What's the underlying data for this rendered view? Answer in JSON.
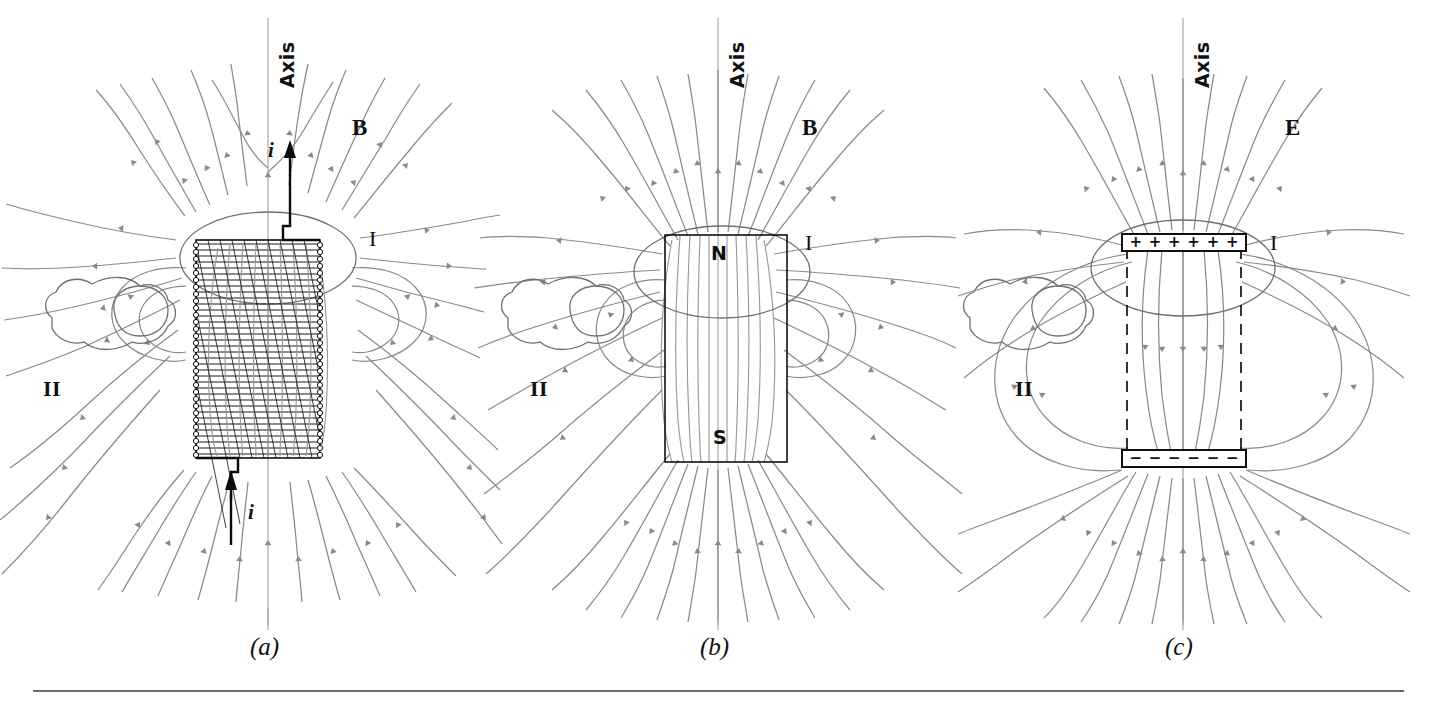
{
  "figure": {
    "caption_rule": true,
    "panels": [
      {
        "id": "a",
        "panel_label": "(a)",
        "axis_label": "Axis",
        "field_symbol": "B",
        "surface_I_label": "I",
        "surface_II_label": "II",
        "current_label_top": "i",
        "current_label_bottom": "i",
        "device": "solenoid",
        "device_description": "current-carrying solenoid with helical windings"
      },
      {
        "id": "b",
        "panel_label": "(b)",
        "axis_label": "Axis",
        "field_symbol": "B",
        "surface_I_label": "I",
        "surface_II_label": "II",
        "pole_top": "N",
        "pole_bottom": "S",
        "device": "bar-magnet",
        "device_description": "bar magnet with north pole up and south pole down"
      },
      {
        "id": "c",
        "panel_label": "(c)",
        "axis_label": "Axis",
        "field_symbol": "E",
        "surface_I_label": "I",
        "surface_II_label": "II",
        "device": "electric-dipole",
        "device_description": "parallel charged plates forming an electric dipole",
        "top_plate_signs": [
          "+",
          "+",
          "+",
          "+",
          "+",
          "+"
        ],
        "bottom_plate_signs": [
          "−",
          "−",
          "−",
          "−",
          "−",
          "−"
        ]
      }
    ]
  },
  "colors": {
    "field_line": "#8a8a8a",
    "axis_line": "#a8a8a8",
    "surface_outline": "#707070",
    "device_outline": "#111111",
    "label_text": "#111111",
    "background": "#ffffff",
    "caption_rule": "#3a3a3a"
  },
  "chart_data": {
    "type": "diagram",
    "panel_count": 3,
    "panels": [
      "(a)",
      "(b)",
      "(c)"
    ],
    "field_symbols": [
      "B",
      "B",
      "E"
    ],
    "surfaces": [
      "I",
      "II"
    ]
  }
}
